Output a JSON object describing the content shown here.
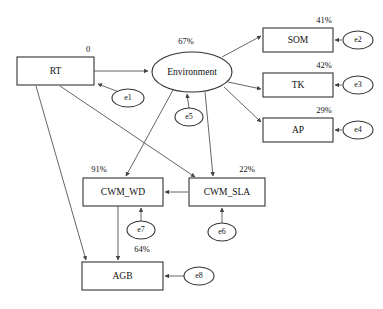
{
  "diagram": {
    "type": "structural-equation-model-path-diagram",
    "latent_variables": [
      {
        "id": "environment",
        "label": "Environment",
        "variance_explained": "67%",
        "shape": "ellipse",
        "cx": 192,
        "cy": 72,
        "rx": 40,
        "ry": 20,
        "pct_x": 186,
        "pct_y": 42
      }
    ],
    "observed_variables": [
      {
        "id": "rt",
        "label": "RT",
        "variance_explained": "0",
        "shape": "rect",
        "x": 17,
        "y": 57,
        "w": 77,
        "h": 28,
        "pct_x": 88,
        "pct_y": 50
      },
      {
        "id": "som",
        "label": "SOM",
        "variance_explained": "41%",
        "shape": "rect",
        "x": 263,
        "y": 28,
        "w": 70,
        "h": 24,
        "pct_x": 324,
        "pct_y": 21
      },
      {
        "id": "tk",
        "label": "TK",
        "variance_explained": "42%",
        "shape": "rect",
        "x": 263,
        "y": 73,
        "w": 70,
        "h": 24,
        "pct_x": 324,
        "pct_y": 66
      },
      {
        "id": "ap",
        "label": "AP",
        "variance_explained": "29%",
        "shape": "rect",
        "x": 263,
        "y": 118,
        "w": 70,
        "h": 24,
        "pct_x": 324,
        "pct_y": 111
      },
      {
        "id": "cwm_wd",
        "label": "CWM_WD",
        "variance_explained": "91%",
        "shape": "rect",
        "x": 83,
        "y": 178,
        "w": 80,
        "h": 28,
        "pct_x": 99,
        "pct_y": 170
      },
      {
        "id": "cwm_sla",
        "label": "CWM_SLA",
        "variance_explained": "22%",
        "shape": "rect",
        "x": 189,
        "y": 178,
        "w": 76,
        "h": 28,
        "pct_x": 247,
        "pct_y": 170
      },
      {
        "id": "agb",
        "label": "AGB",
        "variance_explained": "64%",
        "shape": "rect",
        "x": 82,
        "y": 262,
        "w": 81,
        "h": 28,
        "pct_x": 142,
        "pct_y": 250
      }
    ],
    "error_terms": [
      {
        "id": "e1",
        "label": "e1",
        "cx": 128,
        "cy": 98,
        "rx": 16,
        "ry": 9,
        "target": "rt"
      },
      {
        "id": "e2",
        "label": "e2",
        "cx": 358,
        "cy": 40,
        "rx": 15,
        "ry": 9,
        "target": "som"
      },
      {
        "id": "e3",
        "label": "e3",
        "cx": 358,
        "cy": 85,
        "rx": 15,
        "ry": 9,
        "target": "tk"
      },
      {
        "id": "e4",
        "label": "e4",
        "cx": 358,
        "cy": 130,
        "rx": 15,
        "ry": 9,
        "target": "ap"
      },
      {
        "id": "e5",
        "label": "e5",
        "cx": 189,
        "cy": 117,
        "rx": 14,
        "ry": 9,
        "target": "environment"
      },
      {
        "id": "e6",
        "label": "e6",
        "cx": 222,
        "cy": 232,
        "rx": 14,
        "ry": 9,
        "target": "cwm_sla"
      },
      {
        "id": "e7",
        "label": "e7",
        "cx": 141,
        "cy": 230,
        "rx": 14,
        "ry": 9,
        "target": "cwm_wd"
      },
      {
        "id": "e8",
        "label": "e8",
        "cx": 199,
        "cy": 276,
        "rx": 15,
        "ry": 9,
        "target": "agb"
      }
    ],
    "paths": [
      {
        "from": "rt",
        "to": "environment",
        "d": "M94,71 L148,71"
      },
      {
        "from": "environment",
        "to": "som",
        "d": "M222,57 L261,36"
      },
      {
        "from": "environment",
        "to": "tk",
        "d": "M228,82 L261,89"
      },
      {
        "from": "environment",
        "to": "ap",
        "d": "M224,87 L261,122"
      },
      {
        "from": "environment",
        "to": "cwm_wd",
        "d": "M173,90 L126,176"
      },
      {
        "from": "environment",
        "to": "cwm_sla",
        "d": "M205,92 L213,176"
      },
      {
        "from": "rt",
        "to": "cwm_sla",
        "d": "M60,86 L195,177"
      },
      {
        "from": "rt",
        "to": "agb",
        "d": "M36,86 L86,260"
      },
      {
        "from": "cwm_sla",
        "to": "cwm_wd",
        "d": "M188,192 L165,192"
      },
      {
        "from": "cwm_wd",
        "to": "agb",
        "d": "M118,206 L118,260"
      },
      {
        "from": "e1",
        "to": "rt",
        "d": "M119,92 L98,84"
      },
      {
        "from": "e2",
        "to": "som",
        "d": "M342,40 L335,40"
      },
      {
        "from": "e3",
        "to": "tk",
        "d": "M342,85 L335,85"
      },
      {
        "from": "e4",
        "to": "ap",
        "d": "M342,130 L335,130"
      },
      {
        "from": "e5",
        "to": "environment",
        "d": "M189,108 L187,94"
      },
      {
        "from": "e6",
        "to": "cwm_sla",
        "d": "M222,223 L222,208"
      },
      {
        "from": "e7",
        "to": "cwm_wd",
        "d": "M141,221 L141,208"
      },
      {
        "from": "e8",
        "to": "agb",
        "d": "M184,276 L165,276"
      }
    ]
  }
}
